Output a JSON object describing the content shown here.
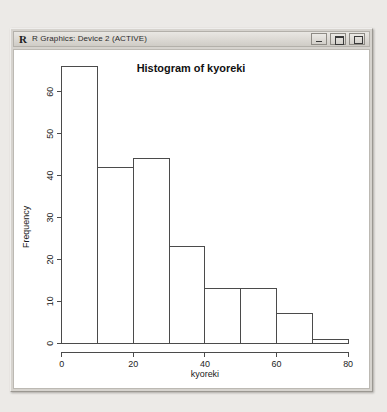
{
  "window": {
    "title": "R Graphics: Device 2 (ACTIVE)",
    "icon": "R",
    "controls": [
      {
        "name": "minimize",
        "label": "Minimize"
      },
      {
        "name": "maximize",
        "label": "Maximize"
      },
      {
        "name": "close",
        "label": "Close"
      }
    ]
  },
  "chart_data": {
    "type": "bar",
    "title": "Histogram of kyoreki",
    "xlabel": "kyoreki",
    "ylabel": "Frequency",
    "categories": [
      "0-10",
      "10-20",
      "20-30",
      "30-40",
      "40-50",
      "50-60",
      "60-70",
      "70-80"
    ],
    "bin_edges": [
      0,
      10,
      20,
      30,
      40,
      50,
      60,
      70,
      80
    ],
    "values": [
      66,
      42,
      44,
      23,
      13,
      13,
      7,
      1
    ],
    "xlim": [
      0,
      80
    ],
    "ylim": [
      0,
      66
    ],
    "xticks": [
      0,
      20,
      40,
      60,
      80
    ],
    "yticks": [
      0,
      10,
      20,
      30,
      40,
      50,
      60
    ],
    "grid": false,
    "legend": null,
    "bar_fill": "#ffffff",
    "bar_stroke": "#4a4a4a"
  }
}
